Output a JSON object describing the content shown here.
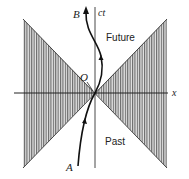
{
  "diagram": {
    "type": "spacetime-light-cone",
    "axes": {
      "vertical_label": "ct",
      "horizontal_label": "x"
    },
    "points": {
      "origin": "O",
      "start": "A",
      "end": "B"
    },
    "regions": {
      "future": "Future",
      "past": "Past"
    },
    "colors": {
      "line": "#222222",
      "hatch": "#555555",
      "background": "#ffffff"
    }
  }
}
